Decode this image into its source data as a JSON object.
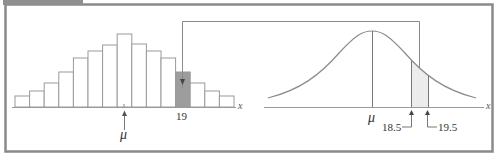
{
  "figure": {
    "title": "",
    "colors": {
      "frame": "#8a8a8a",
      "tab": "#8f8f8f",
      "bar_stroke": "#9a9a9a",
      "highlight_fill": "#9d9d9d",
      "shade_fill": "#ececec",
      "curve": "#8c8c8c",
      "axis": "#9a9a9a",
      "connector": "#8a8a8a"
    }
  },
  "left_panel": {
    "axis_label": "x",
    "mean_label": "μ",
    "highlight_label": "19"
  },
  "right_panel": {
    "axis_label": "x",
    "mean_label": "μ",
    "lower_bound_label": "18.5",
    "upper_bound_label": "19.5"
  },
  "chart_data": [
    {
      "type": "bar",
      "title": "Discrete (binomial) histogram",
      "categories": [
        "b1",
        "b2",
        "b3",
        "b4",
        "b5",
        "b6",
        "b7",
        "b8",
        "b9",
        "b10",
        "b11",
        "19",
        "b13",
        "b14",
        "b15"
      ],
      "values": [
        11,
        16,
        24,
        35,
        49,
        56,
        62,
        73,
        63,
        56,
        49,
        35,
        24,
        16,
        11
      ],
      "highlighted_category": "19",
      "xlabel": "x",
      "annotations": [
        "μ",
        "19"
      ],
      "grid": false
    },
    {
      "type": "line",
      "title": "Normal approximation",
      "xlabel": "x",
      "annotations": [
        "μ",
        "18.5",
        "19.5"
      ],
      "shaded_interval": [
        18.5,
        19.5
      ],
      "grid": false
    }
  ]
}
